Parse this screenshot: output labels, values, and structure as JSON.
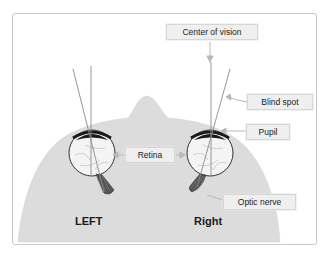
{
  "diagram": {
    "labels": {
      "center_of_vision": "Center of vision",
      "blind_spot": "Blind spot",
      "pupil": "Pupil",
      "retina": "Retina",
      "optic_nerve": "Optic nerve"
    },
    "sides": {
      "left": "LEFT",
      "right": "Right"
    },
    "colors": {
      "head_fill": "#dcdcdc",
      "label_bg": "#efefef",
      "line": "#8a8a8a",
      "pupil": "#1a1a1a",
      "frame_border": "#c8c8c8"
    }
  }
}
